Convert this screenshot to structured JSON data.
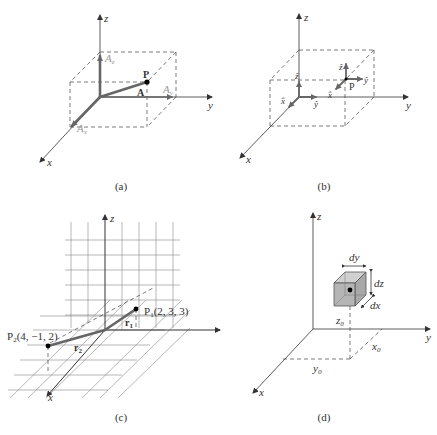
{
  "panels": [
    {
      "id": "a",
      "caption": "(a)",
      "axes": {
        "x": "x",
        "y": "y",
        "z": "z"
      },
      "point": "P",
      "vector": "A",
      "components": {
        "ax": "A",
        "ax_sub": "x",
        "ay": "A",
        "ay_sub": "y",
        "az": "A",
        "az_sub": "z"
      }
    },
    {
      "id": "b",
      "caption": "(b)",
      "axes": {
        "x": "x",
        "y": "y",
        "z": "z"
      },
      "point": "P",
      "unit_vectors": {
        "x": "x̂",
        "y": "ŷ",
        "z": "ẑ"
      }
    },
    {
      "id": "c",
      "caption": "(c)",
      "axes": {
        "x": "x",
        "y": "y",
        "z": "z"
      },
      "p1": {
        "name": "P",
        "sub": "1",
        "coords": "(2, 3, 3)"
      },
      "p2": {
        "name": "P",
        "sub": "2",
        "coords": "(4, −1, 2)"
      },
      "r1": {
        "name": "r",
        "sub": "1"
      },
      "r2": {
        "name": "r",
        "sub": "2"
      }
    },
    {
      "id": "d",
      "caption": "(d)",
      "axes": {
        "x": "x",
        "y": "y",
        "z": "z"
      },
      "differentials": {
        "dx": "dx",
        "dy": "dy",
        "dz": "dz"
      },
      "offsets": {
        "x0": "x",
        "x0_sub": "0",
        "y0": "y",
        "y0_sub": "0",
        "z0": "z",
        "z0_sub": "0"
      }
    }
  ],
  "colors": {
    "axis": "#333333",
    "vector": "#666666",
    "cube_fill": "#b5b5b5",
    "grid": "#888888"
  }
}
